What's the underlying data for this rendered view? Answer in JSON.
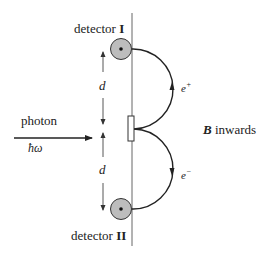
{
  "diagram": {
    "type": "physics-schematic",
    "labels": {
      "detector_top": "detector",
      "detector_top_numeral": "I",
      "detector_bottom": "detector",
      "detector_bottom_numeral": "II",
      "photon": "photon",
      "photon_energy": "ħω",
      "distance_upper": "d",
      "distance_lower": "d",
      "positron": "e",
      "positron_sup": "+",
      "electron": "e",
      "electron_sup": "−",
      "field_symbol": "B",
      "field_direction": "inwards"
    },
    "colors": {
      "line": "#333333",
      "detector_fill": "#bdbdbd",
      "detector_dot": "#111111",
      "background": "#ffffff"
    }
  }
}
